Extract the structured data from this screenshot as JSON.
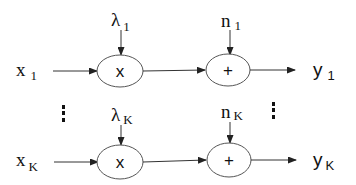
{
  "diagram": {
    "rows": [
      {
        "input": {
          "base": "x",
          "sub": "1"
        },
        "gain": {
          "base": "λ",
          "sub": "1"
        },
        "noise": {
          "base": "n",
          "sub": "1"
        },
        "output": {
          "base": "y",
          "sub": "1"
        },
        "multiplier_symbol": "x",
        "adder_symbol": "+"
      },
      {
        "input": {
          "base": "x",
          "sub": "K"
        },
        "gain": {
          "base": "λ",
          "sub": "K"
        },
        "noise": {
          "base": "n",
          "sub": "K"
        },
        "output": {
          "base": "y",
          "sub": "K"
        },
        "multiplier_symbol": "x",
        "adder_symbol": "+"
      }
    ],
    "ellipsis": "⋮"
  }
}
